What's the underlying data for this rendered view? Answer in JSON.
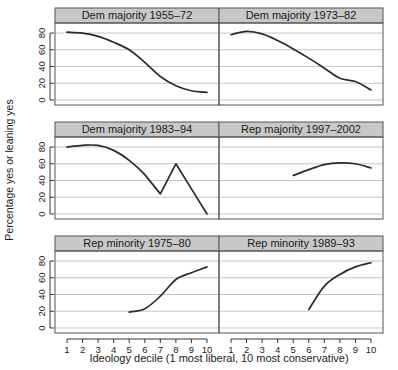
{
  "chart_data": {
    "type": "line",
    "title": "",
    "xlabel": "Ideology decile (1 most liberal, 10 most conservative)",
    "ylabel": "Percentage yes or leaning yes",
    "xlim": [
      1,
      10
    ],
    "ylim": [
      -6,
      92
    ],
    "x": [
      1,
      2,
      3,
      4,
      5,
      6,
      7,
      8,
      9,
      10
    ],
    "yticks": [
      0,
      20,
      40,
      60,
      80
    ],
    "ytick_labels": [
      "0",
      "20",
      "40",
      "60",
      "80"
    ],
    "xticks": [
      1,
      2,
      3,
      4,
      5,
      6,
      7,
      8,
      9,
      10
    ],
    "xtick_labels": [
      "1",
      "2",
      "3",
      "4",
      "5",
      "6",
      "7",
      "8",
      "9",
      "10"
    ],
    "grid": true,
    "grid_axis": "y",
    "legend": "none",
    "layout": "trellis 3 rows x 2 columns",
    "panels": [
      {
        "id": "dem-majority-1955-72",
        "label": "Dem majority 1955–72",
        "row": 1,
        "col": 1,
        "x": [
          1,
          2,
          3,
          4,
          5,
          6,
          7,
          8,
          9,
          10
        ],
        "values": [
          81,
          80,
          76,
          69,
          60,
          45,
          28,
          17,
          11,
          9
        ]
      },
      {
        "id": "dem-majority-1973-82",
        "label": "Dem majority 1973–82",
        "row": 1,
        "col": 2,
        "x": [
          1,
          2,
          3,
          4,
          5,
          6,
          7,
          8,
          9,
          10
        ],
        "values": [
          78,
          82,
          79,
          71,
          61,
          50,
          38,
          26,
          22,
          12
        ]
      },
      {
        "id": "dem-majority-1983-94",
        "label": "Dem majority 1983–94",
        "row": 2,
        "col": 1,
        "x": [
          1,
          2,
          3,
          4,
          5,
          6,
          7,
          8,
          9,
          10
        ],
        "values": [
          80,
          82,
          82,
          76,
          64,
          47,
          24,
          60,
          30,
          0
        ]
      },
      {
        "id": "rep-majority-1997-2002",
        "label": "Rep majority 1997–2002",
        "row": 2,
        "col": 2,
        "x": [
          5,
          6,
          7,
          8,
          9,
          10
        ],
        "values": [
          46,
          53,
          59,
          61,
          60,
          55
        ]
      },
      {
        "id": "rep-minority-1975-80",
        "label": "Rep minority 1975–80",
        "row": 3,
        "col": 1,
        "x": [
          5,
          6,
          7,
          8,
          9,
          10
        ],
        "values": [
          19,
          23,
          38,
          58,
          66,
          73
        ]
      },
      {
        "id": "rep-minority-1989-93",
        "label": "Rep minority 1989–93",
        "row": 3,
        "col": 2,
        "x": [
          6,
          7,
          8,
          9,
          10
        ],
        "values": [
          22,
          50,
          64,
          73,
          78
        ]
      }
    ]
  },
  "axes": {
    "y_title": "Percentage yes or leaning yes",
    "x_title": "Ideology decile (1 most liberal, 10 most conservative)"
  },
  "strips": {
    "p1": "Dem majority 1955–72",
    "p2": "Dem majority 1973–82",
    "p3": "Dem majority 1983–94",
    "p4": "Rep majority 1997–2002",
    "p5": "Rep minority 1975–80",
    "p6": "Rep minority 1989–93"
  },
  "colors": {
    "line": "#2b2b2b",
    "strip_fill": "#c8c8c8",
    "strip_border": "#555555",
    "grid": "#b5b5b5",
    "panel_border": "#555555",
    "background": "#ffffff"
  }
}
